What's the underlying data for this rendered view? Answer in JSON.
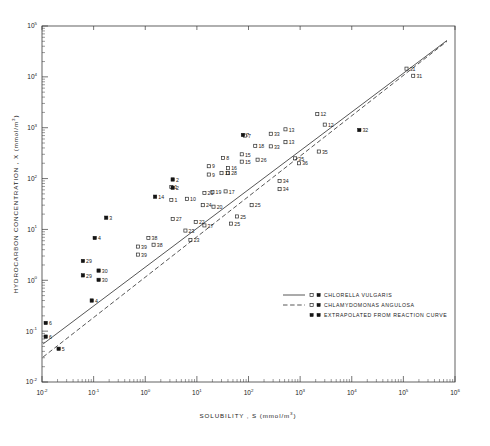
{
  "chart_data": {
    "type": "scatter",
    "title": "",
    "xlabel": "SOLUBILITY , S (mmol/m3)",
    "ylabel": "HYDROCARBON CONCENTRATION , X (mmol/m3)",
    "xscale": "log",
    "yscale": "log",
    "xlim": [
      0.01,
      1000000
    ],
    "ylim": [
      0.01,
      100000
    ],
    "grid": false,
    "legend_position": "lower-right-inside",
    "x_tick_labels": [
      "10-2",
      "10-1",
      "100",
      "101",
      "102",
      "103",
      "104",
      "105",
      "106"
    ],
    "y_tick_labels": [
      "10-2",
      "10-1",
      "100",
      "101",
      "102",
      "103",
      "104",
      "105"
    ],
    "x_tick_mantissas": [
      "10",
      "10",
      "10",
      "10",
      "10",
      "10",
      "10",
      "10",
      "10"
    ],
    "x_tick_exponents": [
      "-2",
      "-1",
      "0",
      "1",
      "2",
      "3",
      "4",
      "5",
      "6"
    ],
    "y_tick_exponents": [
      "-2",
      "-1",
      "0",
      "1",
      "2",
      "3",
      "4",
      "5"
    ],
    "series": [
      {
        "name": "CHLORELLA VULGARIS",
        "marker": "open-square",
        "line": "solid",
        "points": [
          {
            "label": "31",
            "x": 115000,
            "y": 14500
          },
          {
            "label": "12",
            "x": 2150,
            "y": 1850
          },
          {
            "label": "12",
            "x": 3000,
            "y": 1150
          },
          {
            "label": "13",
            "x": 520,
            "y": 930
          },
          {
            "label": "13",
            "x": 520,
            "y": 520
          },
          {
            "label": "33",
            "x": 270,
            "y": 760
          },
          {
            "label": "33",
            "x": 270,
            "y": 430
          },
          {
            "label": "18",
            "x": 135,
            "y": 440
          },
          {
            "label": "35",
            "x": 2300,
            "y": 340
          },
          {
            "label": "35",
            "x": 800,
            "y": 250
          },
          {
            "label": "36",
            "x": 950,
            "y": 200
          },
          {
            "label": "15",
            "x": 74,
            "y": 300
          },
          {
            "label": "15",
            "x": 74,
            "y": 215
          },
          {
            "label": "26",
            "x": 150,
            "y": 235
          },
          {
            "label": "8",
            "x": 32,
            "y": 255
          },
          {
            "label": "9",
            "x": 17,
            "y": 175
          },
          {
            "label": "9",
            "x": 17,
            "y": 120
          },
          {
            "label": "16",
            "x": 40,
            "y": 160
          },
          {
            "label": "28",
            "x": 40,
            "y": 128
          },
          {
            "label": "11",
            "x": 30,
            "y": 128
          },
          {
            "label": "34",
            "x": 400,
            "y": 90
          },
          {
            "label": "34",
            "x": 400,
            "y": 62
          },
          {
            "label": "1",
            "x": 3.2,
            "y": 68
          },
          {
            "label": "1",
            "x": 3.2,
            "y": 38
          },
          {
            "label": "10",
            "x": 6.4,
            "y": 40
          },
          {
            "label": "17",
            "x": 36,
            "y": 56
          },
          {
            "label": "19",
            "x": 20,
            "y": 54
          },
          {
            "label": "21",
            "x": 14,
            "y": 52
          },
          {
            "label": "20",
            "x": 21,
            "y": 28
          },
          {
            "label": "24",
            "x": 13,
            "y": 30
          },
          {
            "label": "25",
            "x": 115,
            "y": 30
          },
          {
            "label": "25",
            "x": 60,
            "y": 18
          },
          {
            "label": "25",
            "x": 46,
            "y": 13
          },
          {
            "label": "27",
            "x": 3.4,
            "y": 16
          },
          {
            "label": "22",
            "x": 9.5,
            "y": 14
          },
          {
            "label": "37",
            "x": 14,
            "y": 12
          },
          {
            "label": "23",
            "x": 6.0,
            "y": 9.5
          },
          {
            "label": "23",
            "x": 7.5,
            "y": 6.2
          },
          {
            "label": "38",
            "x": 1.15,
            "y": 6.8
          },
          {
            "label": "38",
            "x": 1.45,
            "y": 5.0
          },
          {
            "label": "39",
            "x": 0.72,
            "y": 4.6
          },
          {
            "label": "39",
            "x": 0.72,
            "y": 3.2
          }
        ]
      },
      {
        "name": "CHLAMYDOMONAS ANGULOSA",
        "marker": "open-square",
        "line": "dashed",
        "points": [
          {
            "label": "31",
            "x": 155000,
            "y": 10500
          },
          {
            "label": "7",
            "x": 85,
            "y": 700
          }
        ]
      },
      {
        "name": "EXTRAPOLATED FROM REACTION CURVE",
        "marker": "filled-square",
        "line": "none",
        "points": [
          {
            "label": "32",
            "x": 14000,
            "y": 900
          },
          {
            "label": "7",
            "x": 78,
            "y": 720
          },
          {
            "label": "2",
            "x": 3.4,
            "y": 96
          },
          {
            "label": "2",
            "x": 3.4,
            "y": 66
          },
          {
            "label": "14",
            "x": 1.55,
            "y": 44
          },
          {
            "label": "3",
            "x": 0.175,
            "y": 17
          },
          {
            "label": "4",
            "x": 0.105,
            "y": 6.8
          },
          {
            "label": "29",
            "x": 0.062,
            "y": 2.4
          },
          {
            "label": "29",
            "x": 0.062,
            "y": 1.25
          },
          {
            "label": "30",
            "x": 0.125,
            "y": 1.55
          },
          {
            "label": "30",
            "x": 0.125,
            "y": 1.02
          },
          {
            "label": "4",
            "x": 0.092,
            "y": 0.4
          },
          {
            "label": "6",
            "x": 0.0118,
            "y": 0.145
          },
          {
            "label": "6",
            "x": 0.0118,
            "y": 0.078
          },
          {
            "label": "5",
            "x": 0.021,
            "y": 0.045
          }
        ]
      }
    ],
    "fit_lines": [
      {
        "name": "CHLORELLA VULGARIS",
        "style": "solid",
        "x1": 0.0105,
        "y1": 0.056,
        "x2": 700000,
        "y2": 52000
      },
      {
        "name": "CHLAMYDOMONAS ANGULOSA",
        "style": "dashed",
        "x1": 0.0105,
        "y1": 0.031,
        "x2": 700000,
        "y2": 50000
      }
    ],
    "legend": [
      {
        "label": "CHLORELLA VULGARIS",
        "line": "solid",
        "markers": "open+filled"
      },
      {
        "label": "CHLAMYDOMONAS ANGULOSA",
        "line": "dashed",
        "markers": "open+filled"
      },
      {
        "label": "EXTRAPOLATED FROM REACTION CURVE",
        "line": "none",
        "markers": "filled+filled"
      }
    ]
  }
}
